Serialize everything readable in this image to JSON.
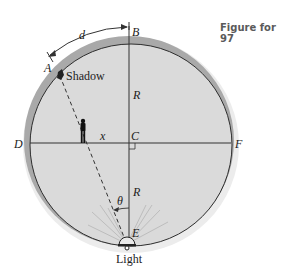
{
  "caption": "Figure for 97",
  "labels": {
    "A": "A",
    "B": "B",
    "C": "C",
    "D": "D",
    "E": "E",
    "F": "F",
    "d": "d",
    "R_top": "R",
    "R_bottom": "R",
    "x": "x",
    "theta": "θ",
    "shadow": "Shadow",
    "light": "Light"
  },
  "colors": {
    "background": "#ffffff",
    "disk_fill": "#d9d9d9",
    "rim": "#a8a8a8",
    "line": "#333333",
    "caption": "#5a5a5a"
  }
}
